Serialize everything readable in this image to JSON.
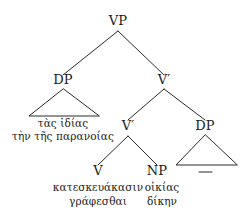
{
  "diagram": {
    "type": "syntax-tree",
    "title": "",
    "ink_color": "#2b2b2b",
    "background_color": "#ffffff"
  },
  "nodes": {
    "vp": "VP",
    "dp_left": "DP",
    "vbar_upper": "V′",
    "vbar_lower": "V′",
    "v": "V",
    "np": "NP",
    "dp_right": "DP"
  },
  "leaves": {
    "dp_left_line1": "τὰς ἰδίας",
    "dp_left_line2": "τὴν τῆς παρανοίας",
    "v_line1": "κατεσκευάκασιν",
    "v_line2": "γράφεσθαι",
    "np_line1": "οἰκίας",
    "np_line2": "δίκην",
    "dp_right_trace": "—"
  }
}
